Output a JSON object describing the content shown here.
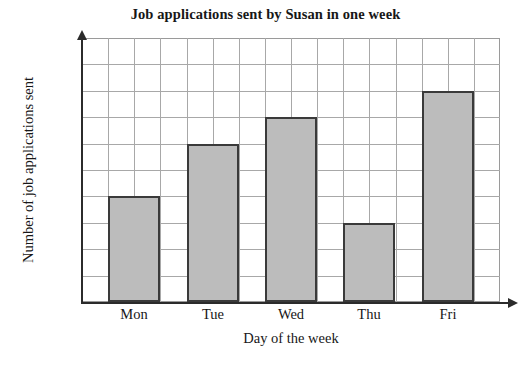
{
  "chart_data": {
    "type": "bar",
    "title": "Job applications sent by Susan in one week",
    "xlabel": "Day of the week",
    "ylabel": "Number of job applications sent",
    "categories": [
      "Mon",
      "Tue",
      "Wed",
      "Thu",
      "Fri"
    ],
    "values": [
      4,
      6,
      7,
      3,
      8
    ],
    "ylim": [
      0,
      10
    ],
    "y_tick_labels": [],
    "grid": true,
    "grid_rows": 10,
    "grid_cols": 16,
    "legend": null,
    "legend_position": "none",
    "annotations": [],
    "colors": {
      "bar_fill": "#bcbcbc",
      "bar_border": "#3a3a3a",
      "grid_line": "#a8a8a8",
      "axis_line": "#2b2b2b",
      "text": "#171717",
      "background": "#ffffff"
    }
  },
  "axes": {
    "y_axis_name": "y-axis",
    "x_axis_name": "x-axis",
    "y_arrow_icon": "arrow-up-icon",
    "x_arrow_icon": "arrow-right-icon"
  }
}
